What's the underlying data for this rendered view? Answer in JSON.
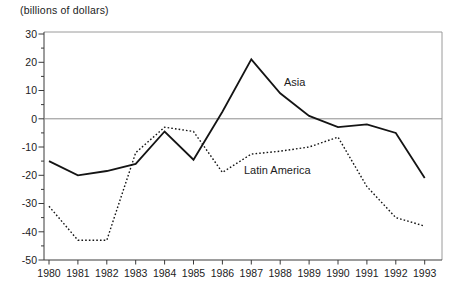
{
  "chart_data": {
    "type": "line",
    "title": "(billions of dollars)",
    "xlabel": "",
    "ylabel": "",
    "x": [
      "1980",
      "1981",
      "1982",
      "1983",
      "1984",
      "1985",
      "1986",
      "1987",
      "1988",
      "1989",
      "1990",
      "1991",
      "1992",
      "1993"
    ],
    "yticks": [
      30,
      20,
      10,
      0,
      -10,
      -20,
      -30,
      -40,
      -50
    ],
    "yminor_step": 5,
    "ylim": [
      -50,
      30
    ],
    "grid": false,
    "zero_line": true,
    "legend": "inline-labels",
    "series": [
      {
        "name": "Asia",
        "line_style": "solid",
        "color": "#141414",
        "values": [
          -15,
          -20,
          -18.5,
          -16,
          -4.5,
          -14.5,
          2.5,
          21,
          9,
          1,
          -3,
          -2,
          -5,
          -21
        ]
      },
      {
        "name": "Latin America",
        "line_style": "dotted",
        "color": "#141414",
        "values": [
          -31,
          -43,
          -43,
          -12,
          -3,
          -4.5,
          -19,
          -12.5,
          -11.5,
          -10,
          -6.5,
          -24,
          -35,
          -38
        ]
      }
    ],
    "colors": {
      "axis": "#3a3a3a",
      "frame": "#9a9a9a",
      "zero_line": "#8d8d8d",
      "text": "#1c1c1c"
    }
  }
}
